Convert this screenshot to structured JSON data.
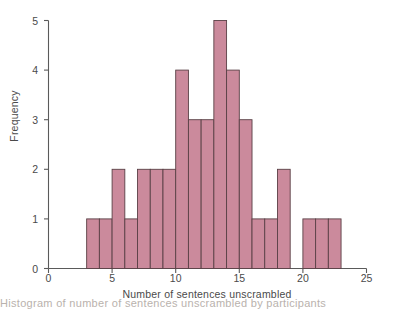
{
  "figure": {
    "background_color": "#ffffff",
    "axis_color": "#5a5a5a",
    "text_color": "#4a4a4a",
    "bar_fill_color": "#cb8a9c",
    "bar_edge_color": "#5a4046"
  },
  "chart_data": {
    "type": "bar",
    "title": "",
    "subtitle": "",
    "xlabel": "Number of sentences unscrambled",
    "ylabel": "Frequency",
    "xlim": [
      0,
      25
    ],
    "ylim": [
      0,
      5
    ],
    "xticks": [
      "0",
      "5",
      "10",
      "15",
      "20",
      "25"
    ],
    "xtick_values": [
      0,
      5,
      10,
      15,
      20,
      25
    ],
    "yticks": [
      "0",
      "1",
      "2",
      "3",
      "4",
      "5"
    ],
    "ytick_values": [
      0,
      1,
      2,
      3,
      4,
      5
    ],
    "grid": false,
    "legend": null,
    "bin_width": 1,
    "categories": [
      3,
      4,
      5,
      6,
      7,
      8,
      9,
      10,
      11,
      12,
      13,
      14,
      15,
      16,
      17,
      18,
      19,
      20,
      21,
      22
    ],
    "values": [
      1,
      1,
      2,
      1,
      2,
      2,
      2,
      4,
      3,
      3,
      5,
      4,
      3,
      1,
      1,
      2,
      0,
      1,
      1,
      1
    ],
    "bins": [
      {
        "start": 3,
        "end": 4,
        "frequency": 1
      },
      {
        "start": 4,
        "end": 5,
        "frequency": 1
      },
      {
        "start": 5,
        "end": 6,
        "frequency": 2
      },
      {
        "start": 6,
        "end": 7,
        "frequency": 1
      },
      {
        "start": 7,
        "end": 8,
        "frequency": 2
      },
      {
        "start": 8,
        "end": 9,
        "frequency": 2
      },
      {
        "start": 9,
        "end": 10,
        "frequency": 2
      },
      {
        "start": 10,
        "end": 11,
        "frequency": 4
      },
      {
        "start": 11,
        "end": 12,
        "frequency": 3
      },
      {
        "start": 12,
        "end": 13,
        "frequency": 3
      },
      {
        "start": 13,
        "end": 14,
        "frequency": 5
      },
      {
        "start": 14,
        "end": 15,
        "frequency": 4
      },
      {
        "start": 15,
        "end": 16,
        "frequency": 3
      },
      {
        "start": 16,
        "end": 17,
        "frequency": 1
      },
      {
        "start": 17,
        "end": 18,
        "frequency": 1
      },
      {
        "start": 18,
        "end": 19,
        "frequency": 2
      },
      {
        "start": 19,
        "end": 20,
        "frequency": 0
      },
      {
        "start": 20,
        "end": 21,
        "frequency": 1
      },
      {
        "start": 21,
        "end": 22,
        "frequency": 1
      },
      {
        "start": 22,
        "end": 23,
        "frequency": 1
      }
    ]
  },
  "caption": {
    "text": "Histogram of number of sentences unscrambled by participants"
  }
}
